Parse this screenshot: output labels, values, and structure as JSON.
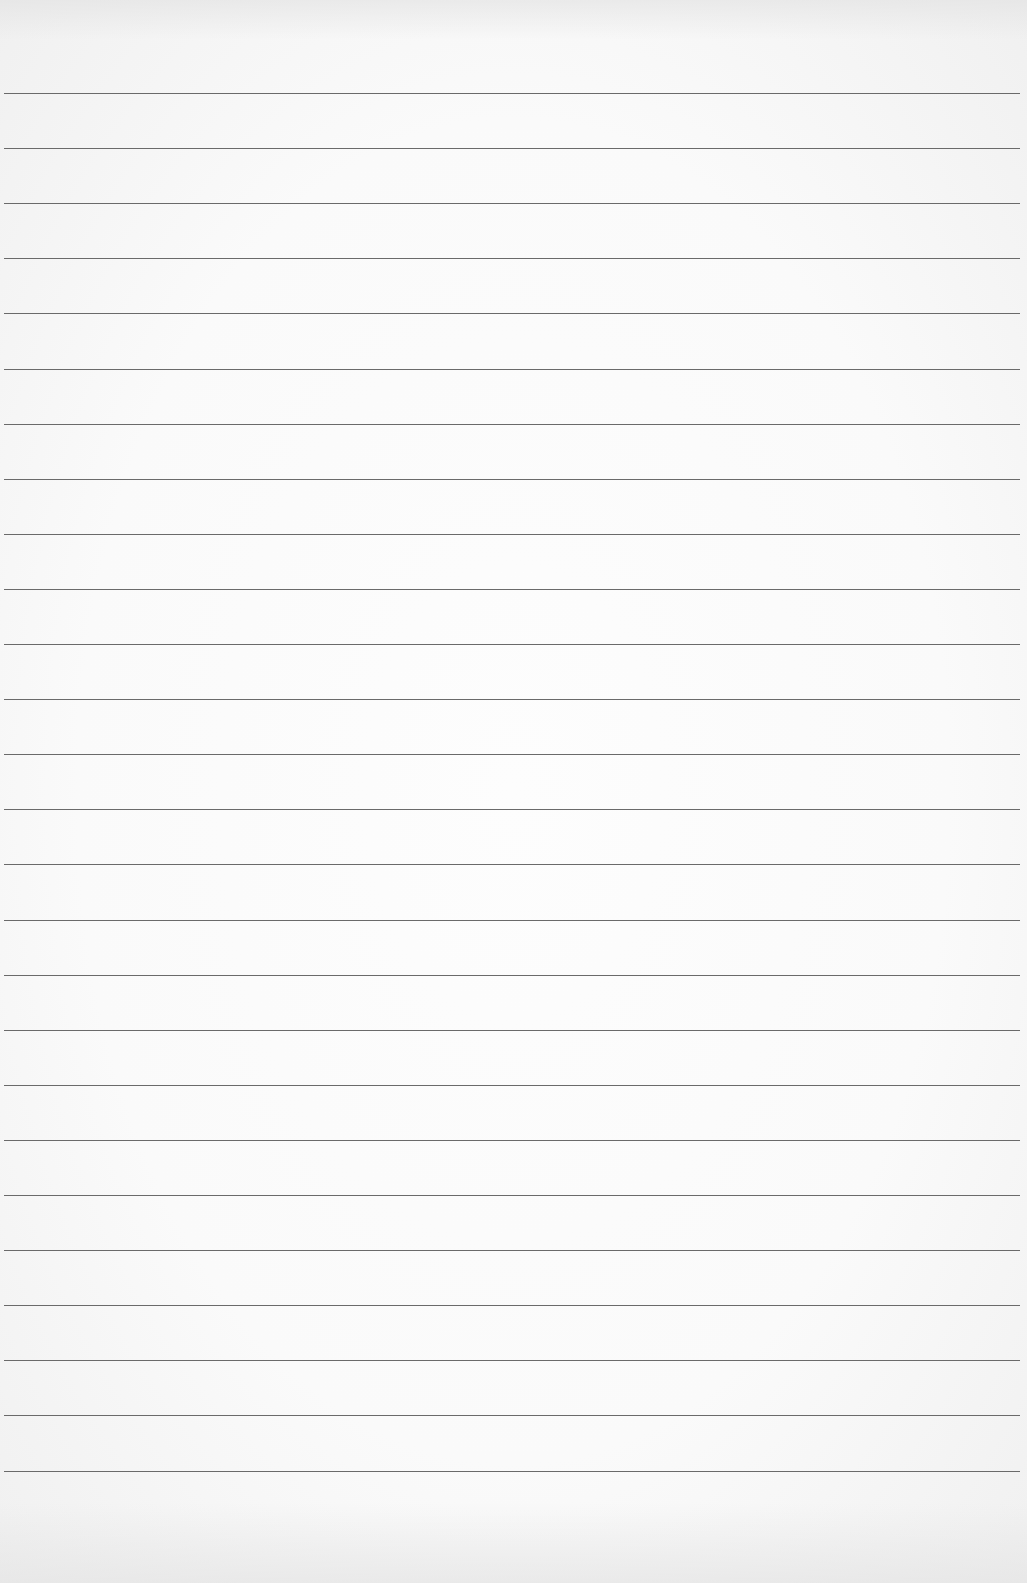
{
  "page": {
    "type": "blank-ruled-paper",
    "line_color": "#6a6a6a",
    "background_color": "#fafafa",
    "rules": {
      "count": 26,
      "first_y": 93,
      "spacing": 55.1,
      "left": 4,
      "width": 1016
    }
  }
}
